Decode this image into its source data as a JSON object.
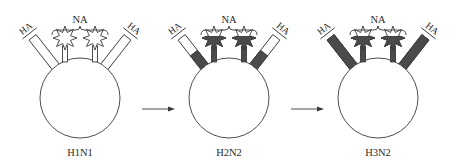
{
  "colors": {
    "ink": "#3a3a3a",
    "mutated": "#4a4a4a",
    "background": "#ffffff"
  },
  "labels": {
    "neuraminidase": "NA",
    "hemagglutinin": "HA"
  },
  "viruses": [
    {
      "name": "H1N1",
      "ha_mutated_fraction": 0,
      "na_mutated": false
    },
    {
      "name": "H2N2",
      "ha_mutated_fraction": 0.5,
      "na_mutated": true
    },
    {
      "name": "H3N2",
      "ha_mutated_fraction": 1,
      "na_mutated": true
    }
  ],
  "transitions": [
    {
      "from": "H1N1",
      "to": "H2N2",
      "icon": "arrow-right-icon"
    },
    {
      "from": "H2N2",
      "to": "H3N2",
      "icon": "arrow-right-icon"
    }
  ]
}
